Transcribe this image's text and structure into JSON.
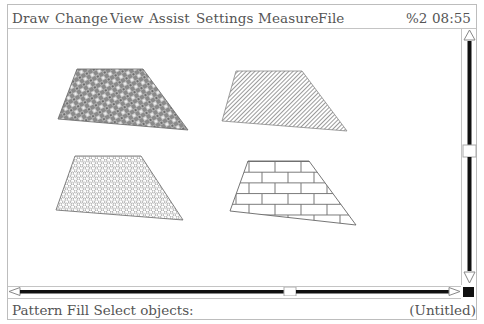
{
  "menubar": {
    "items": [
      {
        "label": "Draw",
        "x": 12
      },
      {
        "label": "Change",
        "x": 55
      },
      {
        "label": "View",
        "x": 110
      },
      {
        "label": "Assist",
        "x": 149
      },
      {
        "label": "Settings",
        "x": 196
      },
      {
        "label": "Measure",
        "x": 258
      },
      {
        "label": "File",
        "x": 318
      }
    ],
    "indicator": "%2",
    "clock": "08:55"
  },
  "canvas": {
    "shapes": [
      {
        "name": "trapezoid-crosshatch-dense",
        "fill": "dense-weave",
        "points": "69,40 135,40 180,101 50,90"
      },
      {
        "name": "trapezoid-diagonal-hatch",
        "fill": "diagonal-lines",
        "points": "228,42 294,42 339,102 214,92"
      },
      {
        "name": "trapezoid-honeycomb",
        "fill": "honeycomb",
        "points": "67,127 133,127 175,191 48,181"
      },
      {
        "name": "trapezoid-brick",
        "fill": "brick",
        "points": "240,132 301,132 348,196 222,182"
      }
    ]
  },
  "scrollbars": {
    "vertical": {
      "up_arrow": "up-arrow-icon",
      "down_arrow": "down-arrow-icon",
      "thumb_y": 117
    },
    "horizontal": {
      "left_arrow": "left-arrow-icon",
      "right_arrow": "right-arrow-icon",
      "thumb_x": 277
    }
  },
  "statusline": {
    "prompt": "Pattern Fill Select objects:",
    "document": "(Untitled)"
  },
  "colors": {
    "frame": "#bdbdbd",
    "text": "#555555",
    "scroll_track": "#111111"
  }
}
